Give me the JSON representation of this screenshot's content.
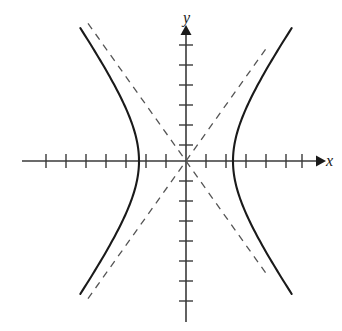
{
  "figure": {
    "type": "hyperbola-graph",
    "background_color": "#ffffff",
    "axis_color": "#3a3a3a",
    "curve_color": "#1a1a1a",
    "asymptote_color": "#555555",
    "x_axis_label": "x",
    "y_axis_label": "y"
  },
  "chart_data": {
    "type": "line",
    "title": "",
    "subtitle": "",
    "xlabel": "x",
    "ylabel": "y",
    "xlim": [
      -7.7,
      7.5
    ],
    "ylim": [
      -7.5,
      6.5
    ],
    "grid": false,
    "legend": "none",
    "axes": {
      "x_axis": {
        "label": "x",
        "tick_count_negative": 7,
        "tick_count_positive": 7,
        "tick_spacing_units": 1,
        "tick_labels": [],
        "arrow_positive_end": true,
        "arrow_negative_end": false,
        "origin_px": [
          186,
          161
        ],
        "unit_px": 20
      },
      "y_axis": {
        "label": "y",
        "tick_count_negative": 7,
        "tick_count_positive": 6,
        "tick_spacing_units": 1,
        "tick_labels": [],
        "arrow_positive_end": true,
        "arrow_negative_end": false
      }
    },
    "series": [
      {
        "name": "hyperbola-right-branch",
        "style": "solid",
        "equation": "x^2/a^2 - y^2/b^2 = 1",
        "a": 2.35,
        "b": 3.3,
        "vertex": [
          2.35,
          0
        ],
        "t_range": [
          -1.45,
          1.45
        ]
      },
      {
        "name": "hyperbola-left-branch",
        "style": "solid",
        "equation": "x^2/a^2 - y^2/b^2 = 1",
        "a": -2.35,
        "b": 3.3,
        "vertex": [
          -2.35,
          0
        ],
        "t_range": [
          -1.45,
          1.45
        ]
      },
      {
        "name": "asymptote-positive-slope",
        "style": "dashed",
        "equation": "y = (b/a)x",
        "slope": 1.404,
        "x_range": [
          -4.9,
          4.0
        ]
      },
      {
        "name": "asymptote-negative-slope",
        "style": "dashed",
        "equation": "y = -(b/a)x",
        "slope": -1.404,
        "x_range": [
          -4.9,
          4.0
        ]
      }
    ]
  }
}
